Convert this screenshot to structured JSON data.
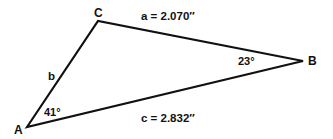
{
  "diagram": {
    "type": "triangle",
    "colors": {
      "line": "#111111",
      "background": "#ffffff",
      "text": "#111111"
    },
    "vertices": {
      "A": {
        "label": "A",
        "x": 27,
        "y": 127
      },
      "B": {
        "label": "B",
        "x": 303,
        "y": 61
      },
      "C": {
        "label": "C",
        "x": 98,
        "y": 21
      }
    },
    "sides": {
      "a": {
        "label": "a = 2.070″"
      },
      "b": {
        "label": "b"
      },
      "c": {
        "label": "c = 2.832″"
      }
    },
    "angles": {
      "A": {
        "label": "41°"
      },
      "B": {
        "label": "23°"
      }
    }
  }
}
